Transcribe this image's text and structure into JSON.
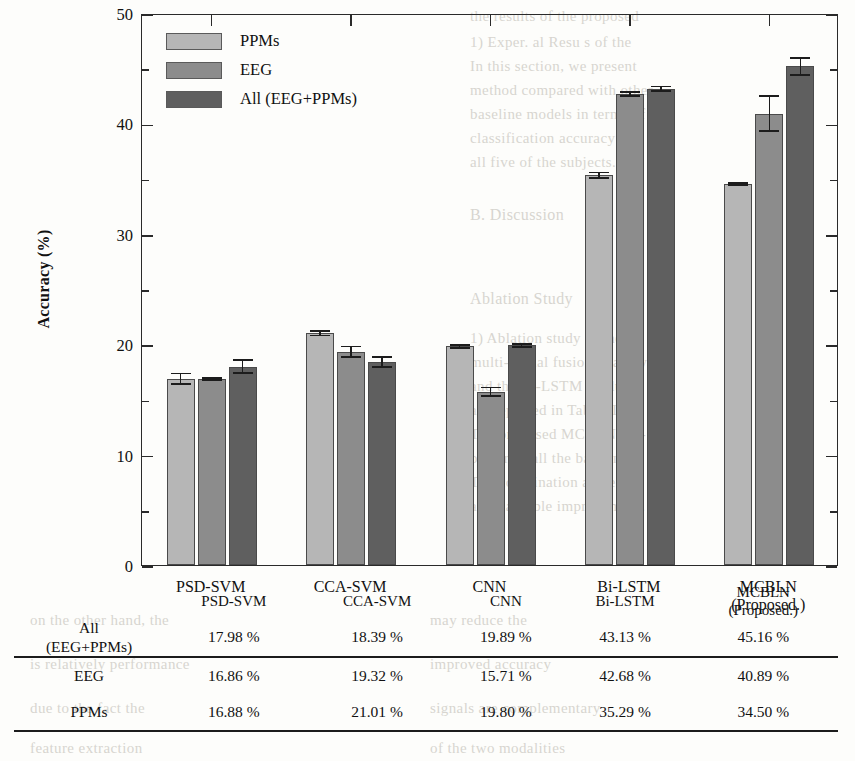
{
  "chart_data": {
    "type": "bar",
    "title": "",
    "xlabel": "",
    "ylabel": "Accuracy (%)",
    "ylim": [
      0,
      50
    ],
    "yticks": [
      0,
      10,
      20,
      30,
      40,
      50
    ],
    "yticks_minor": [
      5,
      15,
      25,
      35,
      45
    ],
    "grid": false,
    "legend_position": "top-left",
    "categories": [
      "PSD-SVM",
      "CCA-SVM",
      "CNN",
      "Bi-LSTM",
      "MCBLN (Proposed.)"
    ],
    "series": [
      {
        "name": "PPMs",
        "color": "#b6b6b6",
        "values": [
          16.88,
          21.01,
          19.8,
          35.29,
          34.5
        ],
        "errors": [
          0.55,
          0.3,
          0.22,
          0.35,
          0.18
        ]
      },
      {
        "name": "EEG",
        "color": "#8c8c8c",
        "values": [
          16.86,
          19.32,
          15.71,
          42.68,
          40.89
        ],
        "errors": [
          0.18,
          0.55,
          0.45,
          0.25,
          1.65
        ]
      },
      {
        "name": "All (EEG+PPMs)",
        "color": "#5f5f5f",
        "values": [
          17.98,
          18.39,
          19.89,
          43.13,
          45.16
        ],
        "errors": [
          0.7,
          0.55,
          0.22,
          0.3,
          0.85
        ]
      }
    ]
  },
  "legend": {
    "items": [
      {
        "label": "PPMs",
        "color": "#b6b6b6"
      },
      {
        "label": "EEG",
        "color": "#8c8c8c"
      },
      {
        "label": "All (EEG+PPMs)",
        "color": "#5f5f5f"
      }
    ]
  },
  "axis": {
    "y_title": "Accuracy (%)",
    "y_tick_labels": [
      "0",
      "10",
      "20",
      "30",
      "40",
      "50"
    ],
    "x_tick_labels": [
      {
        "line1": "PSD-SVM",
        "line2": ""
      },
      {
        "line1": "CCA-SVM",
        "line2": ""
      },
      {
        "line1": "CNN",
        "line2": ""
      },
      {
        "line1": "Bi-LSTM",
        "line2": ""
      },
      {
        "line1": "MCBLN",
        "line2": "(Proposed.)"
      }
    ]
  },
  "table": {
    "corner": "",
    "columns": [
      {
        "line1": "PSD-SVM",
        "line2": ""
      },
      {
        "line1": "CCA-SVM",
        "line2": ""
      },
      {
        "line1": "CNN",
        "line2": ""
      },
      {
        "line1": "Bi-LSTM",
        "line2": ""
      },
      {
        "line1": "MCBLN",
        "line2": "(Proposed.)"
      }
    ],
    "rows": [
      {
        "label_line1": "All",
        "label_line2": "(EEG+PPMs)",
        "cells": [
          "17.98 %",
          "18.39 %",
          "19.89 %",
          "43.13 %",
          "45.16 %"
        ]
      },
      {
        "label_line1": "EEG",
        "label_line2": "",
        "cells": [
          "16.86 %",
          "19.32 %",
          "15.71 %",
          "42.68 %",
          "40.89 %"
        ]
      },
      {
        "label_line1": "PPMs",
        "label_line2": "",
        "cells": [
          "16.88 %",
          "21.01 %",
          "19.80 %",
          "35.29 %",
          "34.50 %"
        ]
      }
    ]
  },
  "background_bleed": [
    {
      "x": 470,
      "y": 8,
      "text": "the  results  of  the  proposed",
      "size": 15
    },
    {
      "x": 470,
      "y": 34,
      "text": "1) Exper.  al  Resu  s  of  the",
      "size": 15
    },
    {
      "x": 470,
      "y": 58,
      "text": "In  this  section,  we  present",
      "size": 15
    },
    {
      "x": 470,
      "y": 82,
      "text": "method  compared  with  other",
      "size": 15
    },
    {
      "x": 470,
      "y": 106,
      "text": "baseline  models  in  terms  of",
      "size": 15
    },
    {
      "x": 470,
      "y": 130,
      "text": "classification  accuracy  for",
      "size": 15
    },
    {
      "x": 470,
      "y": 154,
      "text": "all  five  of  the  subjects.",
      "size": 15
    },
    {
      "x": 470,
      "y": 206,
      "text": "B.  Discussion",
      "size": 16
    },
    {
      "x": 470,
      "y": 290,
      "text": "Ablation  Study",
      "size": 16
    },
    {
      "x": 470,
      "y": 330,
      "text": "1)  Ablation  study  of  the",
      "size": 15
    },
    {
      "x": 470,
      "y": 354,
      "text": "multi-modal  fusion  strategy",
      "size": 15
    },
    {
      "x": 470,
      "y": 378,
      "text": "and  the  Bi-LSTM  module",
      "size": 15
    },
    {
      "x": 470,
      "y": 402,
      "text": "are  reported  in  Table  III.",
      "size": 15
    },
    {
      "x": 470,
      "y": 426,
      "text": "The  proposed  MCBLN  out-",
      "size": 15
    },
    {
      "x": 470,
      "y": 450,
      "text": "performs  all  the  baselines.",
      "size": 15
    },
    {
      "x": 470,
      "y": 474,
      "text": "The  combination  achieves",
      "size": 15
    },
    {
      "x": 470,
      "y": 498,
      "text": "a  remarkable  improvement.",
      "size": 15
    },
    {
      "x": 30,
      "y": 612,
      "text": "on  the  other  hand,  the",
      "size": 15
    },
    {
      "x": 430,
      "y": 612,
      "text": "may  reduce  the",
      "size": 15
    },
    {
      "x": 30,
      "y": 656,
      "text": "is  relatively  performance",
      "size": 15
    },
    {
      "x": 430,
      "y": 656,
      "text": "improved  accuracy",
      "size": 15
    },
    {
      "x": 30,
      "y": 700,
      "text": "due  to  the  fact  the",
      "size": 15
    },
    {
      "x": 430,
      "y": 700,
      "text": "signals  are  complementary",
      "size": 15
    },
    {
      "x": 30,
      "y": 740,
      "text": "feature  extraction",
      "size": 15
    },
    {
      "x": 430,
      "y": 740,
      "text": "of  the  two  modalities",
      "size": 15
    }
  ]
}
